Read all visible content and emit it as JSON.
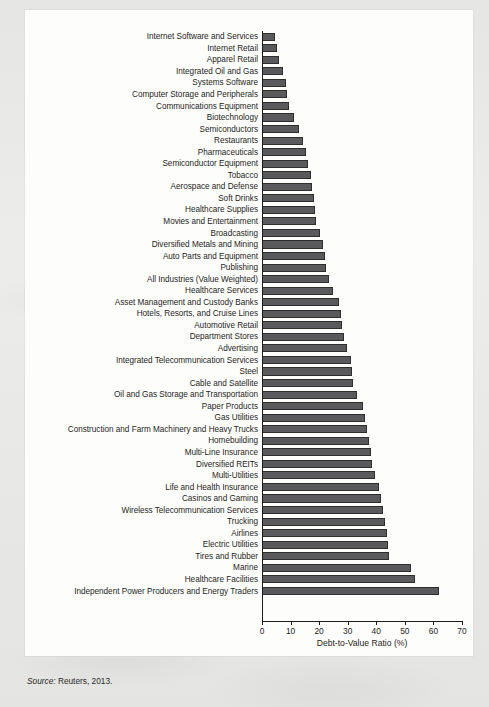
{
  "source": {
    "prefix": "Source:",
    "text": " Reuters, 2013."
  },
  "colors": {
    "bar_fill": "#5a5a5c",
    "bar_stroke": "#2e2e2f",
    "axis": "#1d1d1b",
    "panel": "#fdfdfc",
    "page": "#e9e9e7"
  },
  "chart_data": {
    "type": "bar",
    "orientation": "horizontal",
    "title": "",
    "subtitle": "",
    "xlabel": "Debt-to-Value Ratio (%)",
    "ylabel": "",
    "xlim": [
      0,
      70
    ],
    "xticks": [
      0,
      10,
      20,
      30,
      40,
      50,
      60,
      70
    ],
    "xtick_labels": [
      "0",
      "10",
      "20",
      "30",
      "40",
      "50",
      "60",
      "70"
    ],
    "grid": false,
    "legend": null,
    "series_name": "Debt-to-Value Ratio (%)",
    "categories": [
      "Internet Software and Services",
      "Internet Retail",
      "Apparel Retail",
      "Integrated Oil and Gas",
      "Systems Software",
      "Computer Storage and Peripherals",
      "Communications Equipment",
      "Biotechnology",
      "Semiconductors",
      "Restaurants",
      "Pharmaceuticals",
      "Semiconductor Equipment",
      "Tobacco",
      "Aerospace and Defense",
      "Soft Drinks",
      "Healthcare Supplies",
      "Movies and Entertainment",
      "Broadcasting",
      "Diversified Metals and Mining",
      "Auto Parts and Equipment",
      "Publishing",
      "All Industries (Value Weighted)",
      "Healthcare Services",
      "Asset Management and Custody Banks",
      "Hotels, Resorts, and Cruise Lines",
      "Automotive Retail",
      "Department Stores",
      "Advertising",
      "Integrated Telecommunication Services",
      "Steel",
      "Cable and Satellite",
      "Oil and Gas Storage and Transportation",
      "Paper Products",
      "Gas Utilities",
      "Construction and Farm Machinery and Heavy Trucks",
      "Homebuilding",
      "Multi-Line Insurance",
      "Diversified REITs",
      "Multi-Utilities",
      "Life and Health Insurance",
      "Casinos and Gaming",
      "Wireless Telecommunication Services",
      "Trucking",
      "Airlines",
      "Electric Utilities",
      "Tires and Rubber",
      "Marine",
      "Healthcare Facilities",
      "Independent Power Producers and Energy Traders"
    ],
    "values": [
      4.6,
      5.3,
      6.0,
      7.4,
      8.3,
      8.9,
      9.3,
      11.2,
      13.0,
      14.3,
      15.4,
      16.2,
      17.0,
      17.6,
      18.1,
      18.5,
      19.0,
      20.4,
      21.5,
      22.0,
      22.4,
      23.3,
      24.8,
      27.1,
      27.6,
      28.1,
      28.8,
      29.6,
      31.0,
      31.4,
      32.0,
      33.3,
      35.2,
      36.0,
      36.6,
      37.4,
      38.0,
      38.6,
      39.6,
      41.0,
      41.6,
      42.4,
      43.0,
      43.6,
      44.0,
      44.6,
      52.0,
      53.6,
      62.0
    ]
  }
}
